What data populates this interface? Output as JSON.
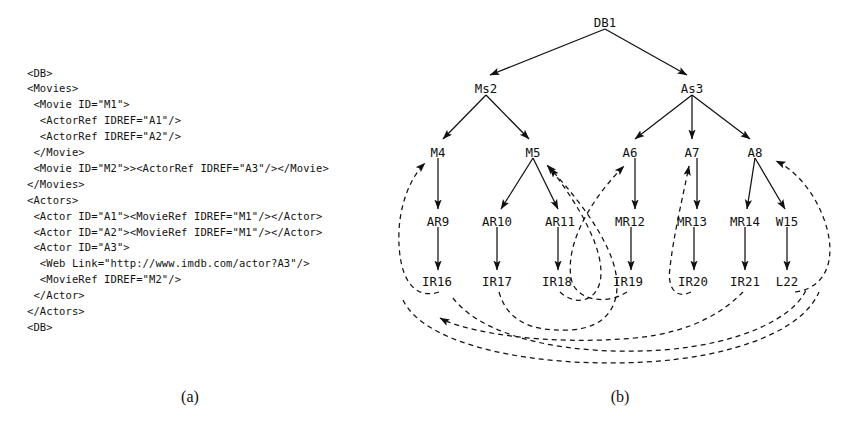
{
  "figure": {
    "caption_a": "(a)",
    "caption_b": "(b)"
  },
  "panel_a": {
    "title": "XML document listing",
    "code": "<DB>\n<Movies>\n <Movie ID=\"M1\">\n  <ActorRef IDREF=\"A1\"/>\n  <ActorRef IDREF=\"A2\"/>\n </Movie>\n <Movie ID=\"M2\">><ActorRef IDREF=\"A3\"/></Movie>\n</Movies>\n<Actors>\n <Actor ID=\"A1\"><MovieRef IDREF=\"M1\"/></Actor>\n <Actor ID=\"A2\"><MovieRef IDREF=\"M1\"/></Actor>\n <Actor ID=\"A3\">\n  <Web Link=\"http://www.imdb.com/actor?A3\"/>\n  <MovieRef IDREF=\"M2\"/>\n </Actor>\n</Actors>\n<DB>"
  },
  "panel_b": {
    "title": "XML graph model",
    "nodes": {
      "db1": {
        "label": "DB1",
        "x": 210,
        "y": 22
      },
      "ms2": {
        "label": "Ms2",
        "x": 91,
        "y": 88
      },
      "as3": {
        "label": "As3",
        "x": 297,
        "y": 88
      },
      "m4": {
        "label": "M4",
        "x": 43,
        "y": 152
      },
      "m5": {
        "label": "M5",
        "x": 138,
        "y": 152
      },
      "a6": {
        "label": "A6",
        "x": 235,
        "y": 152
      },
      "a7": {
        "label": "A7",
        "x": 297,
        "y": 152
      },
      "a8": {
        "label": "A8",
        "x": 360,
        "y": 152
      },
      "ar9": {
        "label": "AR9",
        "x": 43,
        "y": 221
      },
      "ar10": {
        "label": "AR10",
        "x": 102,
        "y": 221
      },
      "ar11": {
        "label": "AR11",
        "x": 165,
        "y": 221
      },
      "mr12": {
        "label": "MR12",
        "x": 235,
        "y": 221
      },
      "mr13": {
        "label": "MR13",
        "x": 297,
        "y": 221
      },
      "mr14": {
        "label": "MR14",
        "x": 350,
        "y": 221
      },
      "w15": {
        "label": "W15",
        "x": 392,
        "y": 221
      },
      "ir16": {
        "label": "IR16",
        "x": 42,
        "y": 281
      },
      "ir17": {
        "label": "IR17",
        "x": 102,
        "y": 281
      },
      "ir18": {
        "label": "IR18",
        "x": 162,
        "y": 281
      },
      "ir19": {
        "label": "IR19",
        "x": 233,
        "y": 281
      },
      "ir20": {
        "label": "IR20",
        "x": 298,
        "y": 281
      },
      "ir21": {
        "label": "IR21",
        "x": 350,
        "y": 281
      },
      "l22": {
        "label": "L22",
        "x": 392,
        "y": 281
      }
    },
    "tree_edges": [
      [
        "db1",
        "ms2"
      ],
      [
        "db1",
        "as3"
      ],
      [
        "ms2",
        "m4"
      ],
      [
        "ms2",
        "m5"
      ],
      [
        "as3",
        "a6"
      ],
      [
        "as3",
        "a7"
      ],
      [
        "as3",
        "a8"
      ],
      [
        "m4",
        "ar9"
      ],
      [
        "m5",
        "ar10"
      ],
      [
        "m5",
        "ar11"
      ],
      [
        "a6",
        "mr12"
      ],
      [
        "a7",
        "mr13"
      ],
      [
        "a8",
        "mr14"
      ],
      [
        "a8",
        "w15"
      ],
      [
        "ar9",
        "ir16"
      ],
      [
        "ar10",
        "ir17"
      ],
      [
        "ar11",
        "ir18"
      ],
      [
        "mr12",
        "ir19"
      ],
      [
        "mr13",
        "ir20"
      ],
      [
        "mr14",
        "ir21"
      ],
      [
        "w15",
        "l22"
      ]
    ],
    "reference_edges": [
      [
        "ir16",
        "m4"
      ],
      [
        "ir17",
        "m5"
      ],
      [
        "ir18",
        "m5"
      ],
      [
        "ir19",
        "a6"
      ],
      [
        "ir20",
        "a7"
      ],
      [
        "ir21",
        "a8"
      ],
      [
        "l22",
        "a8"
      ]
    ],
    "colors": {
      "line": "#111111",
      "text": "#111111",
      "background": "#ffffff"
    }
  }
}
